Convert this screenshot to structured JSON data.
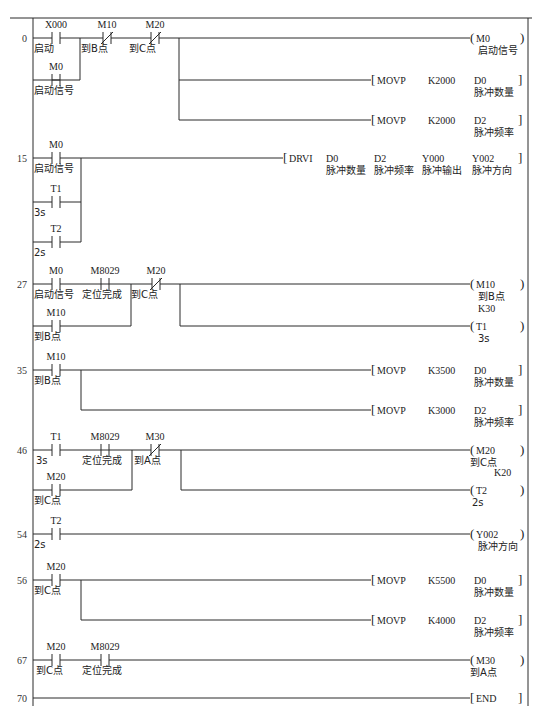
{
  "diagram": {
    "type": "PLC ladder diagram",
    "rungs": [
      {
        "step": "0",
        "contacts": [
          {
            "addr": "X000",
            "comment": "启动",
            "type": "NO"
          },
          {
            "addr": "M10",
            "comment": "到B点",
            "type": "NC"
          },
          {
            "addr": "M20",
            "comment": "到C点",
            "type": "NC"
          }
        ],
        "parallel": [
          {
            "addr": "M0",
            "comment": "启动信号",
            "type": "NO"
          }
        ],
        "outputs": [
          {
            "kind": "coil",
            "addr": "M0",
            "comment": "启动信号"
          },
          {
            "kind": "instr",
            "op": "MOVP",
            "src": "K2000",
            "dst": "D0",
            "dst_comment": "脉冲数量"
          },
          {
            "kind": "instr",
            "op": "MOVP",
            "src": "K2000",
            "dst": "D2",
            "dst_comment": "脉冲频率"
          }
        ]
      },
      {
        "step": "15",
        "contacts": [
          {
            "addr": "M0",
            "comment": "启动信号",
            "type": "NO"
          }
        ],
        "parallel": [
          {
            "addr": "T1",
            "comment": "3s",
            "type": "NO"
          },
          {
            "addr": "T2",
            "comment": "2s",
            "type": "NO"
          }
        ],
        "outputs": [
          {
            "kind": "drvi",
            "op": "DRVI",
            "args": [
              {
                "addr": "D0",
                "comment": "脉冲数量"
              },
              {
                "addr": "D2",
                "comment": "脉冲频率"
              },
              {
                "addr": "Y000",
                "comment": "脉冲输出"
              },
              {
                "addr": "Y002",
                "comment": "脉冲方向"
              }
            ]
          }
        ]
      },
      {
        "step": "27",
        "contacts": [
          {
            "addr": "M0",
            "comment": "启动信号",
            "type": "NO"
          },
          {
            "addr": "M8029",
            "comment": "定位完成",
            "type": "NO"
          },
          {
            "addr": "M20",
            "comment": "到C点",
            "type": "NC"
          }
        ],
        "parallel": [
          {
            "addr": "M10",
            "comment": "到B点",
            "type": "NO"
          }
        ],
        "outputs": [
          {
            "kind": "coil",
            "addr": "M10",
            "comment": "到B点"
          },
          {
            "kind": "timer",
            "addr": "T1",
            "comment": "3s",
            "preset": "K30"
          }
        ]
      },
      {
        "step": "35",
        "contacts": [
          {
            "addr": "M10",
            "comment": "到B点",
            "type": "NO"
          }
        ],
        "outputs": [
          {
            "kind": "instr",
            "op": "MOVP",
            "src": "K3500",
            "dst": "D0",
            "dst_comment": "脉冲数量"
          },
          {
            "kind": "instr",
            "op": "MOVP",
            "src": "K3000",
            "dst": "D2",
            "dst_comment": "脉冲频率"
          }
        ]
      },
      {
        "step": "46",
        "contacts": [
          {
            "addr": "T1",
            "comment": "3s",
            "type": "NO"
          },
          {
            "addr": "M8029",
            "comment": "定位完成",
            "type": "NO"
          },
          {
            "addr": "M30",
            "comment": "到A点",
            "type": "NC"
          }
        ],
        "parallel": [
          {
            "addr": "M20",
            "comment": "到C点",
            "type": "NO"
          }
        ],
        "outputs": [
          {
            "kind": "coil",
            "addr": "M20",
            "comment": "到C点"
          },
          {
            "kind": "timer",
            "addr": "T2",
            "comment": "2s",
            "preset": "K20"
          }
        ]
      },
      {
        "step": "54",
        "contacts": [
          {
            "addr": "T2",
            "comment": "2s",
            "type": "NO"
          }
        ],
        "outputs": [
          {
            "kind": "coil",
            "addr": "Y002",
            "comment": "脉冲方向"
          }
        ]
      },
      {
        "step": "56",
        "contacts": [
          {
            "addr": "M20",
            "comment": "到C点",
            "type": "NO"
          }
        ],
        "outputs": [
          {
            "kind": "instr",
            "op": "MOVP",
            "src": "K5500",
            "dst": "D0",
            "dst_comment": "脉冲数量"
          },
          {
            "kind": "instr",
            "op": "MOVP",
            "src": "K4000",
            "dst": "D2",
            "dst_comment": "脉冲频率"
          }
        ]
      },
      {
        "step": "67",
        "contacts": [
          {
            "addr": "M20",
            "comment": "到C点",
            "type": "NO"
          },
          {
            "addr": "M8029",
            "comment": "定位完成",
            "type": "NO"
          }
        ],
        "outputs": [
          {
            "kind": "coil",
            "addr": "M30",
            "comment": "到A点"
          }
        ]
      },
      {
        "step": "70",
        "outputs": [
          {
            "kind": "instr",
            "op": "END"
          }
        ]
      }
    ]
  }
}
